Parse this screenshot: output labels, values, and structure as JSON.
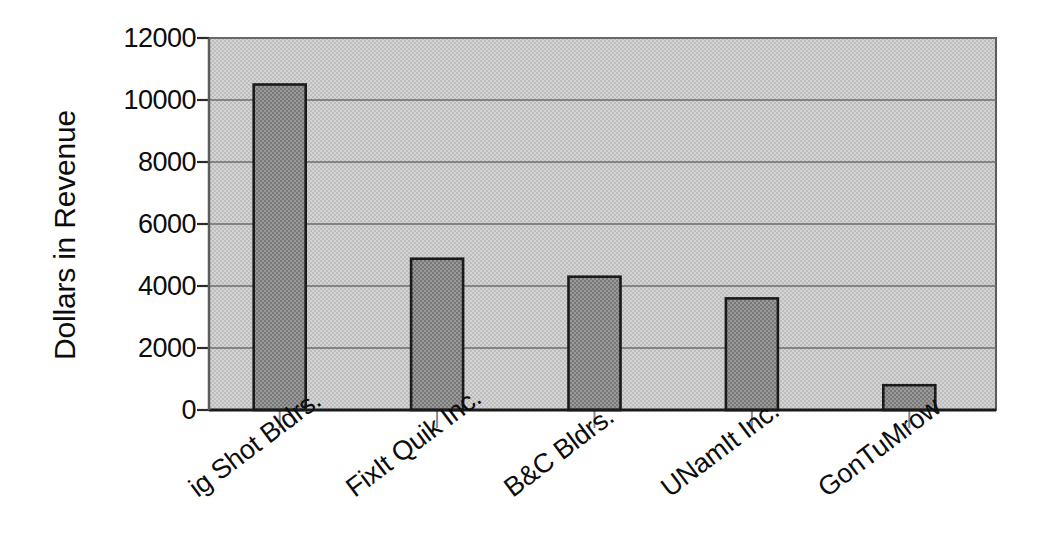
{
  "chart_data": {
    "type": "bar",
    "title": "",
    "xlabel": "",
    "ylabel": "Dollars in Revenue",
    "categories": [
      "Big Shot Bldrs.",
      "FixIt Quik Inc.",
      "B&C Bldrs.",
      "UNamIt Inc.",
      "GonTuMrow"
    ],
    "category_labels_displayed": [
      "ig Shot Bldrs.",
      "FixIt Quik Inc.",
      "B&C Bldrs.",
      "UNamIt Inc.",
      "GonTuMrow"
    ],
    "values": [
      10500,
      4880,
      4300,
      3600,
      800
    ],
    "ylim": [
      0,
      12000
    ],
    "ytick_labels": [
      "0",
      "2000",
      "4000",
      "6000",
      "8000",
      "10000",
      "12000"
    ],
    "ytick_values": [
      0,
      2000,
      4000,
      6000,
      8000,
      10000,
      12000
    ],
    "grid": true,
    "legend": false,
    "legend_position": "none",
    "colors": {
      "bar_fill": "#8c8c8c",
      "bar_edge": "#1a1a1a",
      "plot_background": "#c9c9c9",
      "gridline": "#6e6e6e",
      "axis": "#2b2b2b",
      "text": "#0d0d0d",
      "page_background": "#ffffff"
    }
  }
}
